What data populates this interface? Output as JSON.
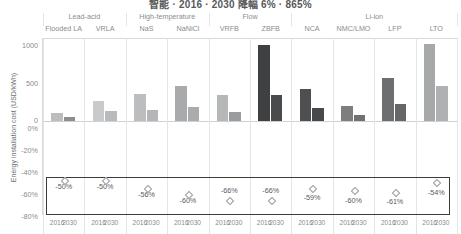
{
  "title": "智能 · 2016 · 2030 降幅 6% · 865%",
  "axis": {
    "y_label": "Energy installation cost (USD/kWh)",
    "y_ticks_cost": [
      "1000",
      "500",
      "0"
    ],
    "y_ticks_pct": [
      "0%",
      "-20%",
      "-40%",
      "-60%",
      "-80%"
    ],
    "x_years": [
      "2016",
      "2030"
    ]
  },
  "groups": [
    {
      "name": "Lead-acid",
      "span": 2
    },
    {
      "name": "High-temperature",
      "span": 2
    },
    {
      "name": "Flow",
      "span": 2
    },
    {
      "name": "Li-ion",
      "span": 4
    }
  ],
  "chart_data": {
    "type": "bar",
    "title": "智能 · 2016 · 2030 降幅 6% · 865%",
    "xlabel": "",
    "ylabel": "Energy installation cost (USD/kWh)",
    "ylim": [
      0,
      1000
    ],
    "grid": false,
    "legend": "none",
    "categories": [
      "Flooded LA",
      "VRLA",
      "NaS",
      "NaNiCl",
      "VRFB",
      "ZBFB",
      "NCA",
      "NMC/LMO",
      "LFP",
      "LTO"
    ],
    "series": [
      {
        "name": "2016",
        "values": [
          105,
          260,
          360,
          460,
          345,
          1010,
          420,
          195,
          570,
          1020
        ]
      },
      {
        "name": "2030",
        "values": [
          55,
          130,
          145,
          185,
          120,
          345,
          170,
          80,
          225,
          470
        ]
      }
    ],
    "reduction_labels": [
      "-50%",
      "-50%",
      "-56%",
      "-60%",
      "-66%",
      "-66%",
      "-59%",
      "-60%",
      "-61%",
      "-54%"
    ],
    "bar_colors": {
      "light": "#c9cacc",
      "mid": "#8a8c8e",
      "dark": "#4a4b4d",
      "darkest": "#3f4042"
    }
  },
  "bars": [
    {
      "cat": "Flooded LA",
      "group": "Lead-acid",
      "y2016": 105,
      "y2030": 55,
      "c2016": "#bcbdbf",
      "c2030": "#8c8e90",
      "pct": "-50%",
      "pct_y": 182,
      "dia_y": 178
    },
    {
      "cat": "VRLA",
      "group": "Lead-acid",
      "y2016": 260,
      "y2030": 130,
      "c2016": "#c9cacc",
      "c2030": "#b9babc",
      "pct": "-50%",
      "pct_y": 182,
      "dia_y": 178
    },
    {
      "cat": "NaS",
      "group": "High-temperature",
      "y2016": 360,
      "y2030": 145,
      "c2016": "#bcbdbf",
      "c2030": "#b4b5b7",
      "pct": "-56%",
      "pct_y": 190,
      "dia_y": 186
    },
    {
      "cat": "NaNiCl",
      "group": "High-temperature",
      "y2016": 460,
      "y2030": 185,
      "c2016": "#a8aaac",
      "c2030": "#aaabad",
      "pct": "-60%",
      "pct_y": 196,
      "dia_y": 192
    },
    {
      "cat": "VRFB",
      "group": "Flow",
      "y2016": 345,
      "y2030": 120,
      "c2016": "#b6b7b9",
      "c2030": "#9a9c9e",
      "pct": "-66%",
      "pct_y": 186,
      "dia_y": 198
    },
    {
      "cat": "ZBFB",
      "group": "Flow",
      "y2016": 1010,
      "y2030": 345,
      "c2016": "#3f4042",
      "c2030": "#4a4b4d",
      "pct": "-66%",
      "pct_y": 186,
      "dia_y": 198
    },
    {
      "cat": "NCA",
      "group": "Li-ion",
      "y2016": 420,
      "y2030": 170,
      "c2016": "#4e4f51",
      "c2030": "#48494b",
      "pct": "-59%",
      "pct_y": 193,
      "dia_y": 186
    },
    {
      "cat": "NMC/LMO",
      "group": "Li-ion",
      "y2016": 195,
      "y2030": 80,
      "c2016": "#7c7e80",
      "c2030": "#6f7173",
      "pct": "-60%",
      "pct_y": 196,
      "dia_y": 188
    },
    {
      "cat": "LFP",
      "group": "Li-ion",
      "y2016": 570,
      "y2030": 225,
      "c2016": "#6c6e70",
      "c2030": "#646668",
      "pct": "-61%",
      "pct_y": 197,
      "dia_y": 190
    },
    {
      "cat": "LTO",
      "group": "Li-ion",
      "y2016": 1020,
      "y2030": 470,
      "c2016": "#a6a8aa",
      "c2030": "#b0b1b3",
      "pct": "-54%",
      "pct_y": 188,
      "dia_y": 180
    }
  ]
}
